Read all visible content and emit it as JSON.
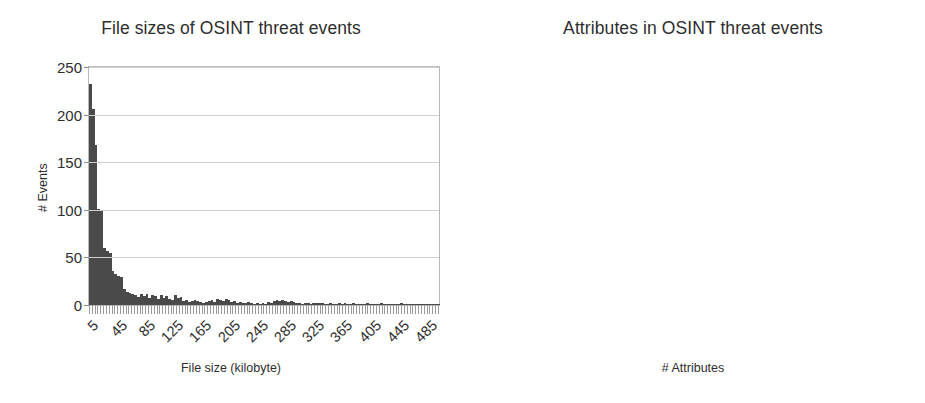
{
  "figure": {
    "background": "#ffffff",
    "bar_color": "#4a4a4a",
    "grid_color": "#cfcfcf",
    "axis_color": "#b9b9b9"
  },
  "charts": [
    {
      "id": "file-sizes",
      "title": "File sizes of OSINT threat events",
      "xlabel": "File size (kilobyte)",
      "ylabel": "# Events",
      "yticks": [
        "0",
        "50",
        "100",
        "150",
        "200",
        "250"
      ],
      "xticks": [
        "5",
        "45",
        "85",
        "125",
        "165",
        "205",
        "245",
        "285",
        "325",
        "365",
        "405",
        "445",
        "485"
      ]
    },
    {
      "id": "attributes",
      "title": "Attributes in OSINT threat events",
      "xlabel": "# Attributes",
      "ylabel": "# Events",
      "yticks": [
        "0",
        "50",
        "100",
        "150",
        "200",
        "250"
      ],
      "xticks": [
        "2",
        "20",
        "37",
        "55",
        "73",
        "90",
        "108",
        "125",
        "143",
        "161",
        "178",
        "196",
        "213"
      ]
    }
  ],
  "chart_data": [
    {
      "type": "bar",
      "id": "file-sizes",
      "title": "File sizes of OSINT threat events",
      "xlabel": "File size (kilobyte)",
      "ylabel": "# Events",
      "ylim": [
        0,
        250
      ],
      "ytick_values": [
        0,
        50,
        100,
        150,
        200,
        250
      ],
      "xtick_labels": [
        "5",
        "45",
        "85",
        "125",
        "165",
        "205",
        "245",
        "285",
        "325",
        "365",
        "405",
        "445",
        "485"
      ],
      "xtick_step": 40,
      "grid": "horizontal",
      "legend": "none",
      "bin_start": 5,
      "bin_width": 4,
      "categories": [
        5,
        9,
        13,
        17,
        21,
        25,
        29,
        33,
        37,
        41,
        45,
        49,
        53,
        57,
        61,
        65,
        69,
        73,
        77,
        81,
        85,
        89,
        93,
        97,
        101,
        105,
        109,
        113,
        117,
        121,
        125,
        129,
        133,
        137,
        141,
        145,
        149,
        153,
        157,
        161,
        165,
        169,
        173,
        177,
        181,
        185,
        189,
        193,
        197,
        201,
        205,
        209,
        213,
        217,
        221,
        225,
        229,
        233,
        237,
        241,
        245,
        249,
        253,
        257,
        261,
        265,
        269,
        273,
        277,
        281,
        285,
        289,
        293,
        297,
        301,
        305,
        309,
        313,
        317,
        321,
        325,
        329,
        333,
        337,
        341,
        345,
        349,
        353,
        357,
        361,
        365,
        369,
        373,
        377,
        381,
        385,
        389,
        393,
        397,
        401,
        405,
        409,
        413,
        417,
        421,
        425,
        429,
        433,
        437,
        441,
        445,
        449,
        453,
        457,
        461,
        465,
        469,
        473,
        477,
        481,
        485,
        489,
        493,
        497
      ],
      "values": [
        232,
        206,
        168,
        101,
        100,
        60,
        57,
        55,
        36,
        33,
        31,
        29,
        17,
        14,
        13,
        12,
        11,
        8,
        12,
        9,
        12,
        7,
        10,
        9,
        6,
        11,
        7,
        9,
        6,
        5,
        10,
        7,
        8,
        4,
        5,
        3,
        4,
        5,
        4,
        3,
        2,
        3,
        4,
        5,
        3,
        6,
        5,
        4,
        6,
        5,
        3,
        4,
        2,
        3,
        2,
        2,
        3,
        2,
        1,
        2,
        1,
        2,
        1,
        3,
        2,
        4,
        5,
        4,
        5,
        4,
        3,
        4,
        3,
        2,
        2,
        1,
        2,
        2,
        1,
        2,
        2,
        2,
        2,
        1,
        1,
        2,
        1,
        1,
        2,
        1,
        2,
        1,
        1,
        2,
        1,
        1,
        1,
        1,
        2,
        1,
        1,
        1,
        1,
        2,
        1,
        1,
        1,
        1,
        1,
        1,
        2,
        1,
        1,
        1,
        1,
        1,
        1,
        1,
        1,
        1,
        1,
        1,
        1,
        1
      ]
    },
    {
      "type": "bar",
      "id": "attributes",
      "title": "Attributes in OSINT threat events",
      "xlabel": "# Attributes",
      "ylabel": "# Events",
      "ylim": [
        0,
        250
      ],
      "ytick_values": [
        0,
        50,
        100,
        150,
        200,
        250
      ],
      "xtick_labels": [
        "2",
        "20",
        "37",
        "55",
        "73",
        "90",
        "108",
        "125",
        "143",
        "161",
        "178",
        "196",
        "213"
      ],
      "xtick_step": 17.6,
      "grid": "horizontal",
      "legend": "none",
      "bin_start": 2,
      "bin_width": 2,
      "categories": [
        2,
        4,
        6,
        8,
        10,
        12,
        14,
        16,
        18,
        20,
        22,
        24,
        26,
        28,
        30,
        32,
        34,
        36,
        38,
        40,
        42,
        44,
        46,
        48,
        50,
        52,
        54,
        56,
        58,
        60,
        62,
        64,
        66,
        68,
        70,
        72,
        74,
        76,
        78,
        80,
        82,
        84,
        86,
        88,
        90,
        92,
        94,
        96,
        98,
        100,
        102,
        104,
        106,
        108,
        110,
        112,
        114,
        116,
        118,
        120,
        122,
        124,
        126,
        128,
        130,
        132,
        134,
        136,
        138,
        140,
        142,
        144,
        146,
        148,
        150,
        152,
        154,
        156,
        158,
        160,
        162,
        164,
        166,
        168,
        170,
        172,
        174,
        176,
        178,
        180,
        182,
        184,
        186,
        188,
        190,
        192,
        194,
        196,
        198,
        200,
        202,
        204,
        206,
        208,
        210,
        212,
        214,
        216,
        218,
        220
      ],
      "values": [
        199,
        25,
        25,
        26,
        24,
        47,
        42,
        64,
        38,
        27,
        20,
        21,
        18,
        19,
        31,
        31,
        17,
        18,
        10,
        21,
        22,
        23,
        35,
        19,
        18,
        13,
        22,
        22,
        12,
        16,
        20,
        16,
        30,
        11,
        20,
        15,
        9,
        11,
        10,
        14,
        13,
        11,
        7,
        10,
        15,
        16,
        14,
        10,
        8,
        7,
        6,
        9,
        8,
        9,
        7,
        18,
        6,
        5,
        4,
        6,
        5,
        9,
        11,
        10,
        8,
        8,
        7,
        9,
        6,
        4,
        9,
        7,
        5,
        4,
        4,
        4,
        6,
        9,
        10,
        8,
        7,
        9,
        7,
        4,
        3,
        5,
        6,
        5,
        4,
        2,
        1,
        1,
        4,
        5,
        5,
        4,
        2,
        3,
        3,
        3,
        2,
        2,
        1,
        1,
        2,
        1,
        2,
        1,
        1,
        3
      ]
    }
  ]
}
